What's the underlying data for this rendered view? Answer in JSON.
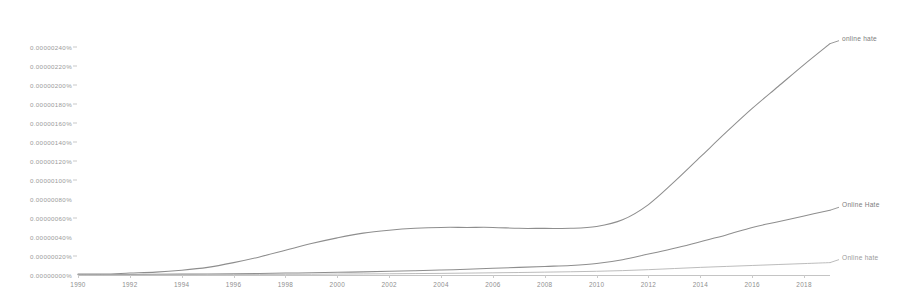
{
  "chart_data": {
    "type": "line",
    "title": "",
    "subtitle": "",
    "xlabel": "",
    "ylabel": "",
    "grid": false,
    "legend_position": "right-inline",
    "xlim": [
      1990,
      2019
    ],
    "ylim": [
      0,
      2.5e-06
    ],
    "x_ticks": [
      1990,
      1992,
      1994,
      1996,
      1998,
      2000,
      2002,
      2004,
      2006,
      2008,
      2010,
      2012,
      2014,
      2016,
      2018
    ],
    "y_ticks": [
      "0.00000000%",
      "0.00000020%",
      "0.00000040%",
      "0.00000060%",
      "0.00000080%",
      "0.00000100%",
      "0.00000120%",
      "0.00000140%",
      "0.00000160%",
      "0.00000180%",
      "0.00000200%",
      "0.00000220%",
      "0.00000240%"
    ],
    "y_tick_values": [
      0,
      2e-07,
      4e-07,
      6e-07,
      8e-07,
      1e-06,
      1.2e-06,
      1.4e-06,
      1.6e-06,
      1.8e-06,
      2e-06,
      2.2e-06,
      2.4e-06
    ],
    "x": [
      1990,
      1991,
      1992,
      1993,
      1994,
      1995,
      1996,
      1997,
      1998,
      1999,
      2000,
      2001,
      2002,
      2003,
      2004,
      2005,
      2006,
      2007,
      2008,
      2009,
      2010,
      2011,
      2012,
      2013,
      2014,
      2015,
      2016,
      2017,
      2018,
      2019
    ],
    "series": [
      {
        "name": "online hate",
        "color": "#8e8e8e",
        "label_color": "#7d7d7d",
        "values": [
          1e-08,
          1e-08,
          2e-08,
          3e-08,
          5e-08,
          8e-08,
          1.3e-07,
          1.9e-07,
          2.6e-07,
          3.3e-07,
          3.9e-07,
          4.4e-07,
          4.7e-07,
          4.9e-07,
          5e-07,
          5e-07,
          5e-07,
          4.9e-07,
          4.9e-07,
          4.9e-07,
          5.1e-07,
          5.8e-07,
          7.4e-07,
          9.8e-07,
          1.24e-06,
          1.5e-06,
          1.75e-06,
          1.98e-06,
          2.21e-06,
          2.43e-06
        ]
      },
      {
        "name": "Online Hate",
        "color": "#8e8e8e",
        "label_color": "#7d7d7d",
        "values": [
          5e-09,
          5e-09,
          6e-09,
          7e-09,
          9e-09,
          1e-08,
          1.3e-08,
          1.6e-08,
          2e-08,
          2.4e-08,
          2.8e-08,
          3.3e-08,
          3.9e-08,
          4.5e-08,
          5.2e-08,
          6e-08,
          7e-08,
          8e-08,
          9e-08,
          1e-07,
          1.2e-07,
          1.6e-07,
          2.2e-07,
          2.8e-07,
          3.5e-07,
          4.2e-07,
          5e-07,
          5.6e-07,
          6.2e-07,
          6.8e-07
        ]
      },
      {
        "name": "Online hate",
        "color": "#b4b4b4",
        "label_color": "#9a9a9a",
        "values": [
          2e-09,
          2e-09,
          2e-09,
          3e-09,
          3e-09,
          4e-09,
          5e-09,
          6e-09,
          7e-09,
          8e-09,
          1e-08,
          1.1e-08,
          1.3e-08,
          1.5e-08,
          1.7e-08,
          2e-08,
          2.3e-08,
          2.6e-08,
          3e-08,
          3.4e-08,
          3.9e-08,
          4.6e-08,
          5.6e-08,
          6.8e-08,
          8e-08,
          9e-08,
          1e-07,
          1.1e-07,
          1.2e-07,
          1.3e-07
        ]
      }
    ]
  }
}
